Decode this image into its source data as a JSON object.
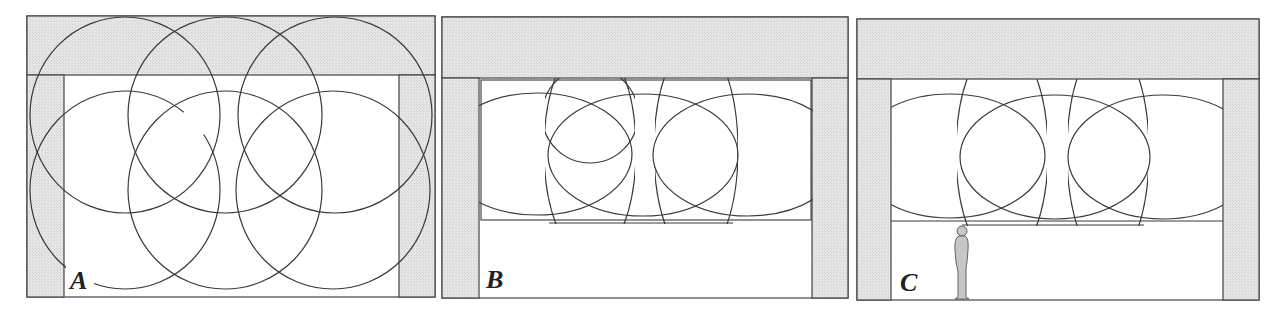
{
  "figure": {
    "colors": {
      "wall_fill": "#e4e4e4",
      "stroke": "#3a3a3a",
      "background": "#ffffff",
      "person_fill": "#c8c8c8"
    },
    "panels": [
      {
        "id": "A",
        "label": "A",
        "frame": {
          "x": 27,
          "y": 16,
          "w": 408,
          "h": 281
        },
        "ceiling_bottom_y": 75,
        "left_wall_inner_x": 64,
        "right_wall_inner_x": 399,
        "beams": [
          {
            "cx": 125,
            "cy": 113,
            "r": 96
          },
          {
            "cx": 225,
            "cy": 113,
            "r": 96
          },
          {
            "cx": 333,
            "cy": 113,
            "r": 96
          },
          {
            "cx": 125,
            "cy": 190,
            "rx": 96,
            "ry": 98
          },
          {
            "cx": 225,
            "cy": 190,
            "rx": 96,
            "ry": 98
          },
          {
            "cx": 333,
            "cy": 190,
            "rx": 96,
            "ry": 98
          }
        ],
        "leader_line": true
      },
      {
        "id": "B",
        "label": "B",
        "frame": {
          "x": 442,
          "y": 17,
          "w": 406,
          "h": 281
        },
        "ceiling_bottom_y": 78,
        "left_wall_inner_x": 479,
        "right_wall_inner_x": 812,
        "light_zone": {
          "x": 479,
          "y": 78,
          "w": 334,
          "h": 142
        },
        "horizontal_beams": [
          {
            "cx": 537,
            "cy": 153,
            "rx": 95,
            "ry": 61
          },
          {
            "cx": 643,
            "cy": 153,
            "rx": 95,
            "ry": 61
          },
          {
            "cx": 748,
            "cy": 153,
            "rx": 95,
            "ry": 61
          }
        ],
        "vertical_lenses": [
          {
            "x1": 545,
            "x2": 635,
            "y1": 78,
            "y2": 223
          },
          {
            "x1": 655,
            "x2": 737,
            "y1": 78,
            "y2": 223
          }
        ],
        "person": false
      },
      {
        "id": "C",
        "label": "C",
        "frame": {
          "x": 857,
          "y": 19,
          "w": 402,
          "h": 281
        },
        "ceiling_bottom_y": 79,
        "left_wall_inner_x": 891,
        "right_wall_inner_x": 1223,
        "light_zone": {
          "x": 891,
          "y": 79,
          "w": 332,
          "h": 142
        },
        "horizontal_beams": [
          {
            "cx": 950,
            "cy": 156,
            "rx": 95,
            "ry": 62
          },
          {
            "cx": 1055,
            "cy": 156,
            "rx": 95,
            "ry": 62
          },
          {
            "cx": 1163,
            "cy": 156,
            "rx": 95,
            "ry": 62
          }
        ],
        "vertical_lenses": [
          {
            "x1": 957,
            "x2": 1047,
            "y1": 79,
            "y2": 225
          },
          {
            "x1": 1068,
            "x2": 1148,
            "y1": 79,
            "y2": 225
          }
        ],
        "person": true,
        "person_position": {
          "x": 961,
          "head_y": 230,
          "feet_y": 299
        }
      }
    ]
  }
}
